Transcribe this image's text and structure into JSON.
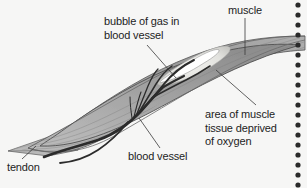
{
  "figure": {
    "kind": "anatomical-diagram",
    "background_color": "#f6f6f5",
    "ink_color": "#1d1d1d",
    "muscle_fill": "#a9a9a9",
    "muscle_fill_dark": "#8e8e8e",
    "muscle_stroke": "#4a4a4a",
    "tendon_fill": "#b5b5b5",
    "vessel_color": "#2b2b2b",
    "deprived_area_fill": "#ededea",
    "bubble_fill": "#ffffff",
    "leader_color": "#3a3a3a",
    "edge_dot_color": "#2a2a2a"
  },
  "labels": {
    "bubble": "bubble of gas in\nblood vessel",
    "muscle": "muscle",
    "area": "area of muscle\ntissue deprived\nof oxygen",
    "vessel": "blood vessel",
    "tendon": "tendon"
  },
  "edge": {
    "dot_count": 19,
    "dot_radius": 2.6,
    "dot_spacing": 10
  }
}
